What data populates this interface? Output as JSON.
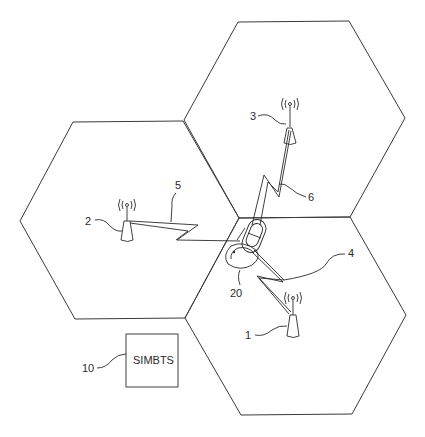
{
  "diagram": {
    "type": "cellular-network-figure",
    "cells": [
      {
        "id": "cell-top",
        "contains": "base-station-3"
      },
      {
        "id": "cell-left",
        "contains": "base-station-2"
      },
      {
        "id": "cell-bottom-right",
        "contains": "base-station-1"
      }
    ],
    "labels": {
      "bs1": "1",
      "bs2": "2",
      "bs3": "3",
      "link4": "4",
      "link5": "5",
      "link6": "6",
      "mobile": "20",
      "simbts_ref": "10",
      "simbts_box": "SIMBTS"
    },
    "base_stations": [
      {
        "ref": "1",
        "name": "base-station-1"
      },
      {
        "ref": "2",
        "name": "base-station-2"
      },
      {
        "ref": "3",
        "name": "base-station-3"
      }
    ],
    "radio_links": [
      {
        "ref": "4",
        "from": "mobile-20",
        "to": "base-station-1"
      },
      {
        "ref": "5",
        "from": "mobile-20",
        "to": "base-station-2"
      },
      {
        "ref": "6",
        "from": "mobile-20",
        "to": "base-station-3"
      }
    ],
    "mobile_station": {
      "ref": "20"
    },
    "simbts": {
      "ref": "10",
      "label": "SIMBTS"
    }
  }
}
